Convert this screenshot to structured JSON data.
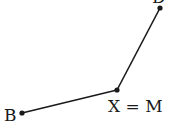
{
  "diagram": {
    "points": [
      {
        "id": "B",
        "label": "B",
        "x": 22,
        "y": 113
      },
      {
        "id": "XM",
        "label": "X = M",
        "x": 117,
        "y": 90
      },
      {
        "id": "top",
        "label": "D",
        "x": 160,
        "y": 8
      }
    ],
    "segments": [
      {
        "from": "B",
        "to": "XM"
      },
      {
        "from": "XM",
        "to": "top"
      }
    ],
    "colors": {
      "stroke": "#1a1a1a",
      "background": "#ffffff"
    }
  }
}
